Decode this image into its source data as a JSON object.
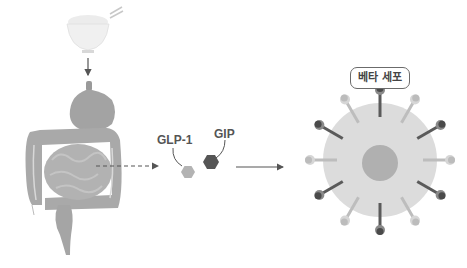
{
  "figure": {
    "type": "biological-process-diagram",
    "flow": [
      "food",
      "stomach",
      "intestines",
      "incretin-hormones",
      "beta-cell"
    ]
  },
  "labels": {
    "glp1": "GLP-1",
    "gip": "GIP",
    "beta_cell": "베타 세포"
  },
  "elements": {
    "food_bowl": {
      "name": "rice-bowl-illustration"
    },
    "digestive_tract": {
      "name": "stomach-and-intestines-illustration"
    },
    "hormones": [
      {
        "name": "GLP-1",
        "shape": "hexagon",
        "color": "#b3b3b3"
      },
      {
        "name": "GIP",
        "shape": "hexagon",
        "color": "#555555"
      }
    ],
    "beta_cell": {
      "body_color": "#dcdcdc",
      "nucleus_color": "#b0b0b0",
      "receptor_count": 12,
      "receptor_pattern": [
        "dark",
        "light",
        "dark",
        "light",
        "dark",
        "light",
        "dark",
        "light",
        "dark",
        "light",
        "dark",
        "light"
      ]
    },
    "arrows": [
      {
        "from": "food",
        "to": "stomach",
        "style": "solid"
      },
      {
        "from": "intestines",
        "to": "hormones",
        "style": "dashed"
      },
      {
        "from": "hormones",
        "to": "beta-cell",
        "style": "solid"
      }
    ]
  },
  "colors": {
    "dark_receptor": "#5a5a5a",
    "light_receptor": "#bdbdbd",
    "organ": "#a8a8a8",
    "text": "#555555"
  }
}
